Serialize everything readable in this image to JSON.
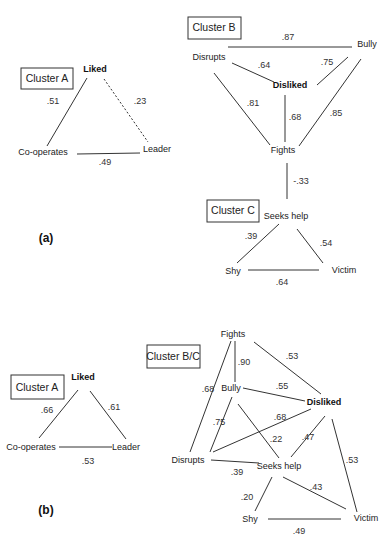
{
  "panels": [
    {
      "label": "(a)",
      "clusters": [
        {
          "name": "Cluster A",
          "nodes": [
            "Liked",
            "Co-operates",
            "Leader"
          ],
          "edges": [
            {
              "from": "Liked",
              "to": "Co-operates",
              "weight": ".51",
              "style": "solid"
            },
            {
              "from": "Liked",
              "to": "Leader",
              "weight": ".23",
              "style": "dashed"
            },
            {
              "from": "Co-operates",
              "to": "Leader",
              "weight": ".49",
              "style": "solid"
            }
          ]
        },
        {
          "name": "Cluster B",
          "nodes": [
            "Disrupts",
            "Bully",
            "Disliked",
            "Fights"
          ],
          "edges": [
            {
              "from": "Disrupts",
              "to": "Bully",
              "weight": ".87"
            },
            {
              "from": "Disrupts",
              "to": "Disliked",
              "weight": ".64"
            },
            {
              "from": "Bully",
              "to": "Disliked",
              "weight": ".75"
            },
            {
              "from": "Disrupts",
              "to": "Fights",
              "weight": ".81"
            },
            {
              "from": "Disliked",
              "to": "Fights",
              "weight": ".68"
            },
            {
              "from": "Bully",
              "to": "Fights",
              "weight": ".85"
            }
          ]
        },
        {
          "name": "Cluster C",
          "nodes": [
            "Seeks help",
            "Shy",
            "Victim"
          ],
          "edges": [
            {
              "from": "Seeks help",
              "to": "Shy",
              "weight": ".39"
            },
            {
              "from": "Seeks help",
              "to": "Victim",
              "weight": ".54"
            },
            {
              "from": "Shy",
              "to": "Victim",
              "weight": ".64"
            }
          ]
        }
      ],
      "between_clusters": [
        {
          "from": "Fights",
          "to": "Seeks help",
          "weight": "-.33"
        }
      ]
    },
    {
      "label": "(b)",
      "clusters": [
        {
          "name": "Cluster A",
          "nodes": [
            "Liked",
            "Co-operates",
            "Leader"
          ],
          "edges": [
            {
              "from": "Liked",
              "to": "Co-operates",
              "weight": ".66"
            },
            {
              "from": "Liked",
              "to": "Leader",
              "weight": ".61"
            },
            {
              "from": "Co-operates",
              "to": "Leader",
              "weight": ".53"
            }
          ]
        },
        {
          "name": "Cluster B/C",
          "nodes": [
            "Fights",
            "Bully",
            "Disliked",
            "Disrupts",
            "Seeks help",
            "Shy",
            "Victim"
          ],
          "edges": [
            {
              "from": "Fights",
              "to": "Bully",
              "weight": ".90"
            },
            {
              "from": "Fights",
              "to": "Disliked",
              "weight": ".53"
            },
            {
              "from": "Fights",
              "to": "Disrupts",
              "weight": ".68"
            },
            {
              "from": "Bully",
              "to": "Disliked",
              "weight": ".55"
            },
            {
              "from": "Bully",
              "to": "Disrupts",
              "weight": ".75"
            },
            {
              "from": "Bully",
              "to": "Seeks help",
              "weight": ".22"
            },
            {
              "from": "Disliked",
              "to": "Disrupts",
              "weight": ".68"
            },
            {
              "from": "Disliked",
              "to": "Seeks help",
              "weight": ".47"
            },
            {
              "from": "Disliked",
              "to": "Victim",
              "weight": ".53"
            },
            {
              "from": "Disrupts",
              "to": "Seeks help",
              "weight": ".39"
            },
            {
              "from": "Seeks help",
              "to": "Shy",
              "weight": ".20"
            },
            {
              "from": "Seeks help",
              "to": "Victim",
              "weight": ".43"
            },
            {
              "from": "Shy",
              "to": "Victim",
              "weight": ".49"
            }
          ]
        }
      ]
    }
  ],
  "text": {
    "a": {
      "panel": "(a)",
      "clusterA": "Cluster A",
      "clusterB": "Cluster B",
      "clusterC": "Cluster C",
      "liked": "Liked",
      "cooperates": "Co-operates",
      "leader": "Leader",
      "disrupts": "Disrupts",
      "bully": "Bully",
      "disliked": "Disliked",
      "fights": "Fights",
      "seeks": "Seeks help",
      "shy": "Shy",
      "victim": "Victim",
      "w_liked_coop": ".51",
      "w_liked_leader": ".23",
      "w_coop_leader": ".49",
      "w_disrupts_bully": ".87",
      "w_disrupts_disliked": ".64",
      "w_bully_disliked": ".75",
      "w_disrupts_fights": ".81",
      "w_disliked_fights": ".68",
      "w_bully_fights": ".85",
      "w_fights_seeks": "-.33",
      "w_seeks_shy": ".39",
      "w_seeks_victim": ".54",
      "w_shy_victim": ".64"
    },
    "b": {
      "panel": "(b)",
      "clusterA": "Cluster A",
      "clusterBC": "Cluster B/C",
      "liked": "Liked",
      "cooperates": "Co-operates",
      "leader": "Leader",
      "fights": "Fights",
      "bully": "Bully",
      "disliked": "Disliked",
      "disrupts": "Disrupts",
      "seeks": "Seeks help",
      "shy": "Shy",
      "victim": "Victim",
      "w_liked_coop": ".66",
      "w_liked_leader": ".61",
      "w_coop_leader": ".53",
      "w_fights_bully": ".90",
      "w_fights_disliked": ".53",
      "w_fights_disrupts": ".68",
      "w_bully_disliked": ".55",
      "w_bully_disrupts": ".75",
      "w_bully_seeks": ".22",
      "w_disliked_disrupts": ".68",
      "w_disliked_seeks": ".47",
      "w_disliked_victim": ".53",
      "w_disrupts_seeks": ".39",
      "w_seeks_shy": ".20",
      "w_seeks_victim": ".43",
      "w_shy_victim": ".49"
    }
  }
}
